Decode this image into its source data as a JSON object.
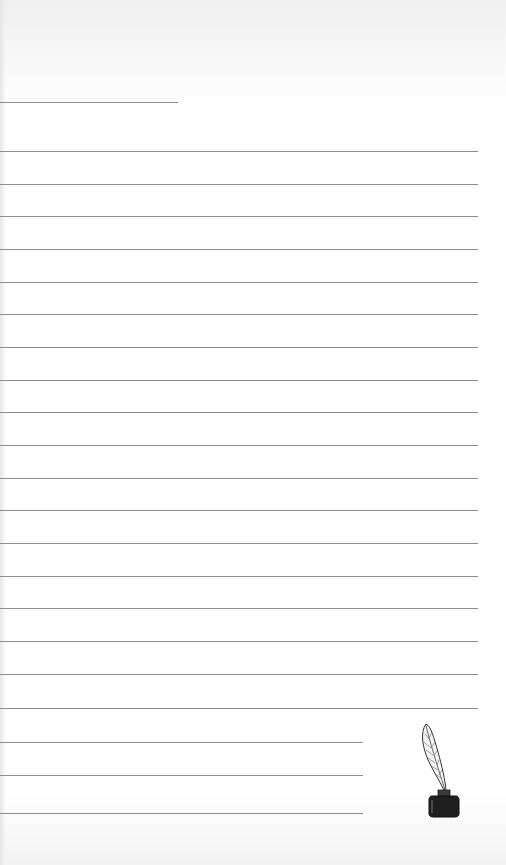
{
  "page": {
    "type": "lined-writing-paper",
    "background": "#ffffff",
    "line_color": "#8d8d8d"
  },
  "title_line": {
    "y": 102,
    "width": 178
  },
  "lines": [
    {
      "y": 151,
      "width": 478
    },
    {
      "y": 184,
      "width": 478
    },
    {
      "y": 216,
      "width": 478
    },
    {
      "y": 249,
      "width": 478
    },
    {
      "y": 282,
      "width": 478
    },
    {
      "y": 314,
      "width": 478
    },
    {
      "y": 347,
      "width": 478
    },
    {
      "y": 380,
      "width": 478
    },
    {
      "y": 412,
      "width": 478
    },
    {
      "y": 445,
      "width": 478
    },
    {
      "y": 478,
      "width": 478
    },
    {
      "y": 510,
      "width": 478
    },
    {
      "y": 543,
      "width": 478
    },
    {
      "y": 576,
      "width": 478
    },
    {
      "y": 608,
      "width": 478
    },
    {
      "y": 641,
      "width": 478
    },
    {
      "y": 674,
      "width": 478
    },
    {
      "y": 708,
      "width": 478
    },
    {
      "y": 742,
      "width": 363
    },
    {
      "y": 775,
      "width": 363
    },
    {
      "y": 813,
      "width": 363
    }
  ],
  "decoration": {
    "icon": "quill-and-inkwell-icon"
  }
}
